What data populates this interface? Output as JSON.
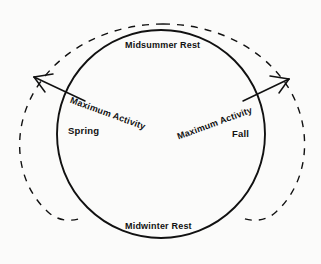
{
  "figure": {
    "type": "cycle-diagram",
    "background_color": "#fbfbfa",
    "stroke_color": "#111111"
  },
  "labels": {
    "midsummer_rest": "Midsummer Rest",
    "midwinter_rest": "Midwinter Rest",
    "spring": "Spring",
    "fall": "Fall",
    "maximum_activity_spring": "Maximum Activity",
    "maximum_activity_fall": "Maximum Activity"
  },
  "shapes": {
    "solid_circle": {
      "name": "annual-cycle-circle",
      "center_x": 161,
      "center_y": 134,
      "radius": 104,
      "style": "solid"
    },
    "dashed_arc_left": {
      "name": "expansion-arc-left",
      "style": "dashed"
    },
    "dashed_arc_right": {
      "name": "expansion-arc-right",
      "style": "dashed"
    }
  },
  "arrows": {
    "left": {
      "name": "spring-expansion-arrow",
      "direction": "up-left",
      "tail_x": 85,
      "tail_y": 101,
      "head_x": 33,
      "head_y": 77
    },
    "right": {
      "name": "fall-expansion-arrow",
      "direction": "up-right",
      "tail_x": 243,
      "tail_y": 101,
      "head_x": 289,
      "head_y": 79
    }
  }
}
